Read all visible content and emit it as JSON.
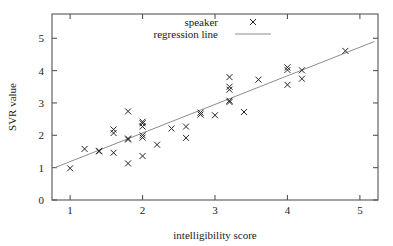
{
  "chart_data": {
    "type": "scatter",
    "title": "",
    "xlabel": "intelligibility score",
    "ylabel": "SVR value",
    "xlim": [
      0.75,
      5.25
    ],
    "ylim": [
      0,
      5.75
    ],
    "xticks": [
      "1",
      "2",
      "3",
      "4",
      "5"
    ],
    "xtick_values": [
      1,
      2,
      3,
      4,
      5
    ],
    "yticks": [
      "0",
      "1",
      "2",
      "3",
      "4",
      "5"
    ],
    "ytick_values": [
      0,
      1,
      2,
      3,
      4,
      5
    ],
    "grid": false,
    "legend_position": "top-center",
    "legend": [
      {
        "label": "speaker",
        "marker": "x",
        "color": "#242424"
      },
      {
        "label": "regression line",
        "marker": "line",
        "color": "#8d8d8d"
      }
    ],
    "series": [
      {
        "name": "speaker",
        "marker": "x",
        "points": [
          [
            1.0,
            0.98
          ],
          [
            1.2,
            1.58
          ],
          [
            1.4,
            1.5
          ],
          [
            1.4,
            1.52
          ],
          [
            1.6,
            2.18
          ],
          [
            1.6,
            2.07
          ],
          [
            1.6,
            1.46
          ],
          [
            1.8,
            2.74
          ],
          [
            1.8,
            1.9
          ],
          [
            1.8,
            1.87
          ],
          [
            1.8,
            1.13
          ],
          [
            2.0,
            2.42
          ],
          [
            2.0,
            2.37
          ],
          [
            2.0,
            2.27
          ],
          [
            2.0,
            2.0
          ],
          [
            2.0,
            1.93
          ],
          [
            2.0,
            1.36
          ],
          [
            2.2,
            1.71
          ],
          [
            2.4,
            2.21
          ],
          [
            2.6,
            2.27
          ],
          [
            2.6,
            1.92
          ],
          [
            2.8,
            2.7
          ],
          [
            2.8,
            2.64
          ],
          [
            3.0,
            2.62
          ],
          [
            3.2,
            3.8
          ],
          [
            3.2,
            3.5
          ],
          [
            3.2,
            3.41
          ],
          [
            3.2,
            3.07
          ],
          [
            3.2,
            3.03
          ],
          [
            3.4,
            2.72
          ],
          [
            3.6,
            3.72
          ],
          [
            4.0,
            4.1
          ],
          [
            4.0,
            4.02
          ],
          [
            4.0,
            3.56
          ],
          [
            4.2,
            4.01
          ],
          [
            4.2,
            3.75
          ],
          [
            4.8,
            4.61
          ]
        ]
      }
    ],
    "regression_line": {
      "name": "regression line",
      "x": [
        0.8,
        5.2
      ],
      "y": [
        1.01,
        4.9
      ]
    }
  }
}
